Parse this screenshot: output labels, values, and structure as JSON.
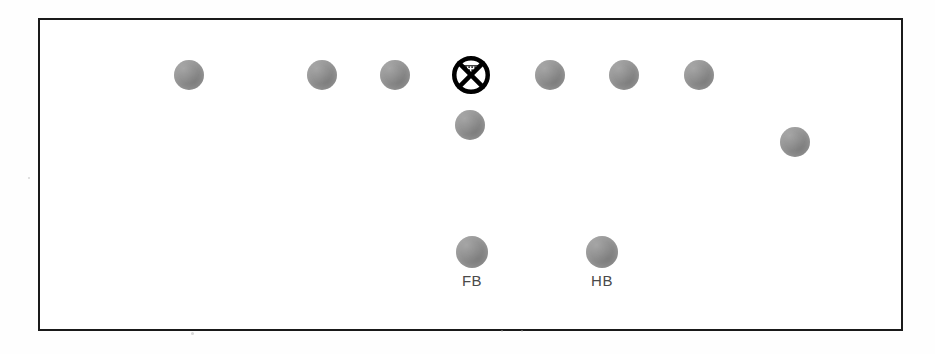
{
  "figure": {
    "type": "football-formation-diagram",
    "frame": {
      "x": 38,
      "y": 18,
      "width": 865,
      "height": 313,
      "border_color": "#1a1a1a",
      "border_width": 2.5
    },
    "background_color": "#ffffff",
    "player_color": "#8d8d8d",
    "marker_color": "#000000",
    "label_color": "#4a4a4a"
  },
  "players": [
    {
      "id": "p1",
      "name": "player-token-1",
      "row": "line",
      "cx": 187,
      "cy": 73,
      "r": 15,
      "label": ""
    },
    {
      "id": "p2",
      "name": "player-token-2",
      "row": "line",
      "cx": 320,
      "cy": 73,
      "r": 15,
      "label": ""
    },
    {
      "id": "p3",
      "name": "player-token-3",
      "row": "line",
      "cx": 393,
      "cy": 73,
      "r": 15,
      "label": ""
    },
    {
      "id": "p4",
      "name": "player-token-4",
      "row": "line",
      "cx": 548,
      "cy": 73,
      "r": 15,
      "label": ""
    },
    {
      "id": "p5",
      "name": "player-token-5",
      "row": "line",
      "cx": 622,
      "cy": 73,
      "r": 15,
      "label": ""
    },
    {
      "id": "p6",
      "name": "player-token-6",
      "row": "line",
      "cx": 697,
      "cy": 73,
      "r": 15,
      "label": ""
    },
    {
      "id": "p7",
      "name": "player-token-7",
      "row": "backfield-near",
      "cx": 468,
      "cy": 123,
      "r": 15,
      "label": ""
    },
    {
      "id": "p8",
      "name": "player-token-8",
      "row": "wide-right",
      "cx": 793,
      "cy": 140,
      "r": 15,
      "label": ""
    },
    {
      "id": "p9",
      "name": "player-token-fullback",
      "row": "backfield-deep",
      "cx": 470,
      "cy": 250,
      "r": 16,
      "label": "FB"
    },
    {
      "id": "p10",
      "name": "player-token-halfback",
      "row": "backfield-deep",
      "cx": 600,
      "cy": 250,
      "r": 16,
      "label": "HB"
    }
  ],
  "marker": {
    "id": "m1",
    "name": "crossed-circle-marker",
    "cx": 469,
    "cy": 73,
    "r": 19,
    "glyph": "crossed-circle-with-hatching",
    "stroke_width": 4.5
  },
  "labels": [
    {
      "id": "lbl-fb",
      "text": "FB",
      "x": 470,
      "y": 270
    },
    {
      "id": "lbl-hb",
      "text": "HB",
      "x": 600,
      "y": 270
    }
  ],
  "speckles": [
    {
      "x": 189,
      "y": 330,
      "size": 3
    },
    {
      "x": 499,
      "y": 328,
      "size": 2
    },
    {
      "x": 519,
      "y": 328,
      "size": 2
    },
    {
      "x": 26,
      "y": 175,
      "size": 2
    }
  ]
}
